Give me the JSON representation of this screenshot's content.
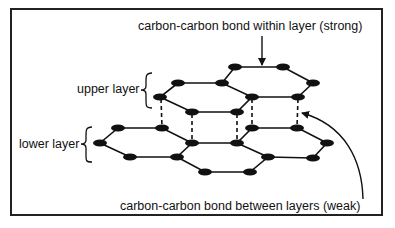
{
  "diagram": {
    "labels": {
      "within_layer": "carbon-carbon bond within layer (strong)",
      "between_layers": "carbon-carbon bond between layers (weak)",
      "upper_layer": "upper layer",
      "lower_layer": "lower layer"
    },
    "colors": {
      "atom": "#111111",
      "bond": "#111111",
      "border": "#222222",
      "background": "#ffffff"
    }
  }
}
